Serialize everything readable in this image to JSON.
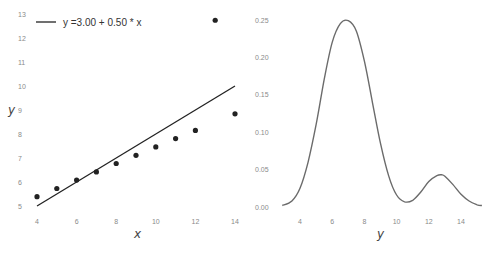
{
  "chart_data": [
    {
      "type": "scatter",
      "title": "",
      "xlabel": "x",
      "ylabel": "y",
      "xlim": [
        3.8,
        14.3
      ],
      "ylim": [
        4.8,
        13.3
      ],
      "xticks": [
        4,
        6,
        8,
        10,
        12,
        14
      ],
      "yticks": [
        5,
        6,
        7,
        8,
        9,
        10,
        11,
        12,
        13
      ],
      "grid": false,
      "legend_position": "upper left",
      "legend": [
        "y =3.00 + 0.50 * x"
      ],
      "series": [
        {
          "name": "points",
          "type": "scatter",
          "x": [
            4,
            5,
            6,
            7,
            8,
            9,
            10,
            11,
            12,
            13,
            14
          ],
          "y": [
            5.39,
            5.73,
            6.08,
            6.42,
            6.77,
            7.11,
            7.46,
            7.81,
            8.15,
            12.74,
            8.84
          ],
          "color": "#222222"
        },
        {
          "name": "y =3.00 + 0.50 * x",
          "type": "line",
          "x": [
            4,
            14
          ],
          "y": [
            5.0,
            10.0
          ],
          "intercept": 3.0,
          "slope": 0.5,
          "color": "#222222"
        }
      ]
    },
    {
      "type": "line",
      "title": "",
      "xlabel": "y",
      "ylabel": "",
      "xlim": [
        2.5,
        15.8
      ],
      "ylim": [
        -0.005,
        0.26
      ],
      "xticks": [
        4,
        6,
        8,
        10,
        12,
        14
      ],
      "yticks": [
        "0.00",
        "0.05",
        "0.10",
        "0.15",
        "0.20",
        "0.25"
      ],
      "grid": false,
      "series": [
        {
          "name": "kde",
          "x": [
            2.9,
            3.5,
            4.0,
            4.5,
            5.0,
            5.5,
            6.0,
            6.5,
            7.0,
            7.5,
            8.0,
            8.5,
            9.0,
            9.5,
            10.0,
            10.5,
            11.0,
            11.5,
            12.0,
            12.5,
            12.8,
            13.0,
            13.5,
            14.0,
            14.5,
            15.0,
            15.3
          ],
          "y": [
            0.002,
            0.008,
            0.025,
            0.06,
            0.11,
            0.17,
            0.22,
            0.245,
            0.249,
            0.235,
            0.195,
            0.14,
            0.085,
            0.042,
            0.016,
            0.007,
            0.009,
            0.02,
            0.034,
            0.042,
            0.043,
            0.041,
            0.03,
            0.017,
            0.008,
            0.003,
            0.002
          ],
          "color": "#6b6b6b"
        }
      ]
    }
  ],
  "left_chart": {
    "legend_label": "y =3.00 + 0.50 * x",
    "xlabel": "x",
    "ylabel": "y",
    "xtick_labels": [
      "4",
      "6",
      "8",
      "10",
      "12",
      "14"
    ],
    "ytick_labels": [
      "5",
      "6",
      "7",
      "8",
      "9",
      "10",
      "11",
      "12",
      "13"
    ]
  },
  "right_chart": {
    "xlabel": "y",
    "xtick_labels": [
      "4",
      "6",
      "8",
      "10",
      "12",
      "14"
    ],
    "ytick_labels": [
      "0.00",
      "0.05",
      "0.10",
      "0.15",
      "0.20",
      "0.25"
    ]
  }
}
